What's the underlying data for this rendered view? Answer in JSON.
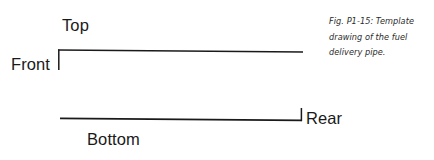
{
  "figure": {
    "canvas": {
      "width": 434,
      "height": 160,
      "background": "#ffffff"
    },
    "line_color": "#1a1a1a",
    "labels": {
      "top": "Top",
      "front": "Front",
      "bottom": "Bottom",
      "rear": "Rear"
    },
    "caption": {
      "line1": "Fig. P1-15: Template",
      "line2": "drawing of the fuel",
      "line3": "delivery pipe."
    },
    "geometry": {
      "top_edge": {
        "x1": 58,
        "y1": 50,
        "x2": 303,
        "y2": 52
      },
      "front_tick": {
        "x1": 58.5,
        "y1": 50,
        "x2": 58.5,
        "y2": 70
      },
      "bottom_edge": {
        "x1": 60,
        "y1": 118.5,
        "x2": 302,
        "y2": 120.5
      },
      "rear_tick": {
        "x1": 301.5,
        "y1": 120.5,
        "x2": 301.5,
        "y2": 108
      },
      "stroke_width": 1.6
    }
  }
}
